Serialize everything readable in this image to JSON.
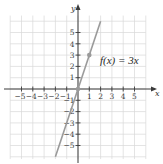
{
  "chart_data": {
    "type": "line",
    "title": "",
    "xlabel": "x",
    "ylabel": "y",
    "xlim": [
      -6,
      6
    ],
    "ylim": [
      -6,
      6
    ],
    "grid": true,
    "x_ticks": [
      -5,
      -4,
      -3,
      -2,
      -1,
      1,
      2,
      3,
      4,
      5
    ],
    "y_ticks": [
      -5,
      -4,
      -3,
      -2,
      -1,
      1,
      2,
      3,
      4,
      5
    ],
    "x_tick_labels": [
      "−5",
      "−4",
      "−3",
      "−2",
      "−1",
      "1",
      "2",
      "3",
      "4",
      "5"
    ],
    "y_tick_labels": [
      "−5",
      "−4",
      "−3",
      "−2",
      "−1",
      "1",
      "2",
      "3",
      "4",
      "5"
    ],
    "series": [
      {
        "name": "f(x) = 3x",
        "equation": "f(x) = 3x",
        "x": [
          -2,
          2
        ],
        "y": [
          -6,
          6
        ],
        "color": "#9a9a9a"
      }
    ],
    "points": [
      {
        "x": 0,
        "y": 0,
        "color": "#9a9a9a"
      },
      {
        "x": 1,
        "y": 3,
        "color": "#9a9a9a"
      }
    ],
    "annotations": [
      {
        "text": "f(x) = 3x",
        "x": 1.6,
        "y": 2.2
      }
    ]
  },
  "labels": {
    "x_axis": "x",
    "y_axis": "y",
    "function": "f(x) = 3x"
  }
}
